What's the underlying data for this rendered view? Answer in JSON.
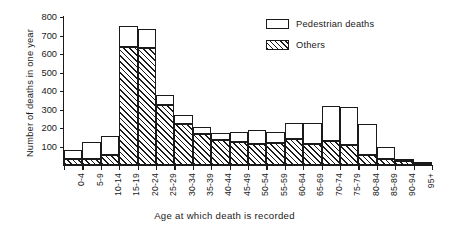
{
  "chart_data": {
    "type": "bar",
    "stacked": true,
    "title": "",
    "xlabel": "Age at which death is recorded",
    "ylabel": "Number of deaths in one year",
    "ylim": [
      0,
      800
    ],
    "yticks": [
      100,
      200,
      300,
      400,
      500,
      600,
      700,
      800
    ],
    "grid": false,
    "legend_position": "top-right",
    "categories": [
      "0-4",
      "5-9",
      "10-14",
      "15-19",
      "20-24",
      "25-29",
      "30-34",
      "35-39",
      "40-44",
      "45-49",
      "50-54",
      "55-59",
      "60-64",
      "65-69",
      "70-74",
      "75-79",
      "80-84",
      "85-89",
      "90-94",
      "95+"
    ],
    "series": [
      {
        "name": "Others",
        "values": [
          30,
          30,
          55,
          640,
          635,
          325,
          220,
          170,
          135,
          125,
          115,
          120,
          140,
          115,
          130,
          110,
          55,
          30,
          20,
          5
        ]
      },
      {
        "name": "Pedestrian deaths",
        "values": [
          50,
          95,
          100,
          110,
          100,
          55,
          50,
          35,
          40,
          55,
          75,
          60,
          85,
          110,
          190,
          205,
          165,
          70,
          10,
          5
        ]
      }
    ],
    "totals": [
      80,
      125,
      155,
      750,
      735,
      380,
      270,
      205,
      175,
      180,
      190,
      180,
      225,
      225,
      320,
      315,
      220,
      100,
      30,
      10
    ]
  },
  "legend": {
    "items": [
      {
        "label": "Pedestrian deaths",
        "swatch": "white-box"
      },
      {
        "label": "Others",
        "swatch": "hatched-box"
      }
    ]
  },
  "colors": {
    "ink": "#1a1a1a",
    "background": "#ffffff",
    "pedestrian_fill": "#ffffff",
    "others_fill": "hatched"
  }
}
